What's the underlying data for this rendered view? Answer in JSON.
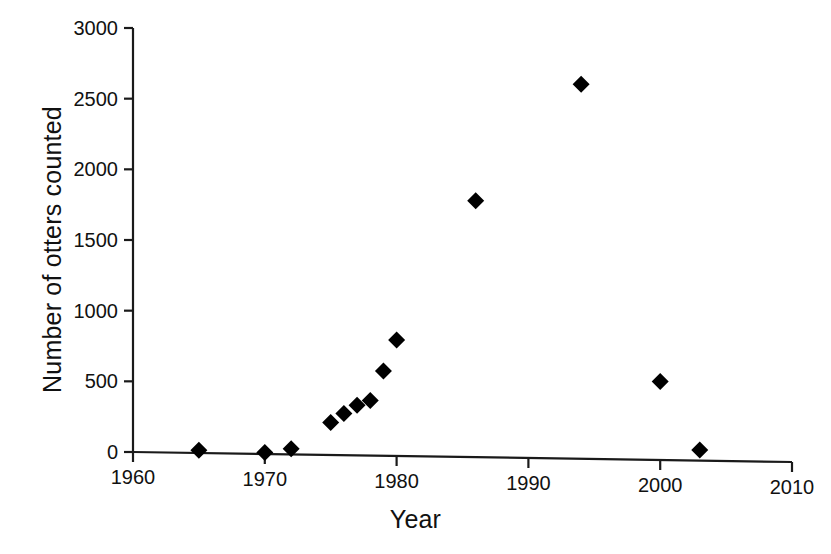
{
  "chart_data": {
    "type": "scatter",
    "title": "",
    "xlabel": "Year",
    "ylabel": "Number of otters counted",
    "xlim": [
      1960,
      2010
    ],
    "ylim": [
      0,
      3000
    ],
    "xticks": [
      1960,
      1970,
      1980,
      1990,
      2000,
      2010
    ],
    "yticks": [
      0,
      500,
      1000,
      1500,
      2000,
      2500,
      3000
    ],
    "grid": false,
    "legend": null,
    "marker": "diamond",
    "marker_color": "#000000",
    "series": [
      {
        "name": "Otters counted",
        "points": [
          {
            "x": 1965,
            "y": 20
          },
          {
            "x": 1970,
            "y": 10
          },
          {
            "x": 1972,
            "y": 40
          },
          {
            "x": 1975,
            "y": 230
          },
          {
            "x": 1976,
            "y": 295
          },
          {
            "x": 1977,
            "y": 355
          },
          {
            "x": 1978,
            "y": 390
          },
          {
            "x": 1979,
            "y": 600
          },
          {
            "x": 1980,
            "y": 820
          },
          {
            "x": 1986,
            "y": 1815
          },
          {
            "x": 1994,
            "y": 2650
          },
          {
            "x": 2000,
            "y": 555
          },
          {
            "x": 2003,
            "y": 75
          }
        ]
      }
    ]
  },
  "axis": {
    "x_tick_labels": [
      "1960",
      "1970",
      "1980",
      "1990",
      "2000",
      "2010"
    ],
    "y_tick_labels": [
      "0",
      "500",
      "1000",
      "1500",
      "2000",
      "2500",
      "3000"
    ],
    "x_title": "Year",
    "y_title": "Number of otters counted"
  }
}
